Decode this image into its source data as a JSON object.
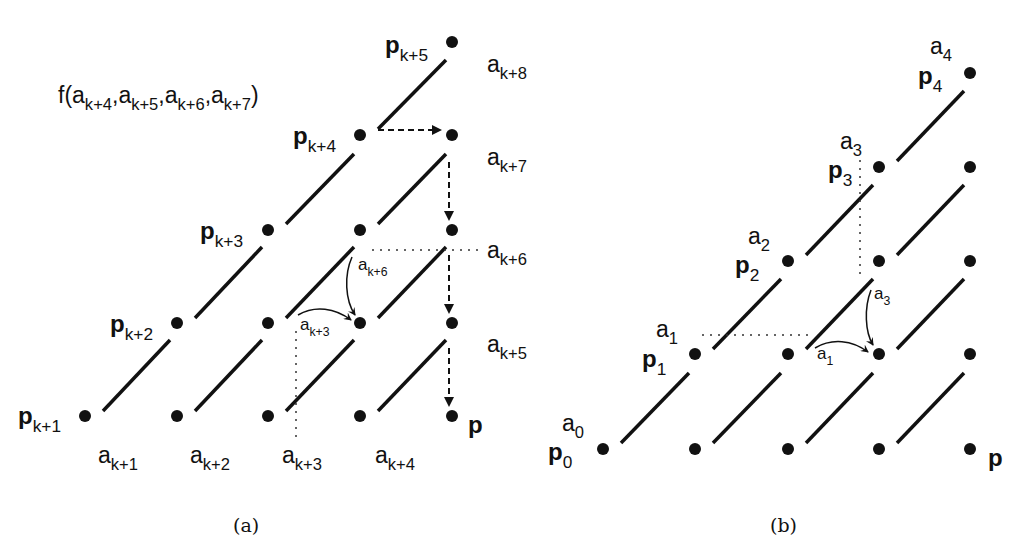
{
  "panel_a": {
    "caption": "(a)",
    "function_label": {
      "prefix": "f(",
      "args": [
        {
          "base": "a",
          "sub": "k+4"
        },
        {
          "base": "a",
          "sub": "k+5"
        },
        {
          "base": "a",
          "sub": "k+6"
        },
        {
          "base": "a",
          "sub": "k+7"
        }
      ],
      "suffix": ")"
    },
    "point_labels": [
      {
        "base": "p",
        "sub": "k+1"
      },
      {
        "base": "p",
        "sub": "k+2"
      },
      {
        "base": "p",
        "sub": "k+3"
      },
      {
        "base": "p",
        "sub": "k+4"
      },
      {
        "base": "p",
        "sub": "k+5"
      },
      {
        "base": "p",
        "sub": ""
      }
    ],
    "bottom_labels": [
      {
        "base": "a",
        "sub": "k+1"
      },
      {
        "base": "a",
        "sub": "k+2"
      },
      {
        "base": "a",
        "sub": "k+3"
      },
      {
        "base": "a",
        "sub": "k+4"
      }
    ],
    "right_labels": [
      {
        "base": "a",
        "sub": "k+8"
      },
      {
        "base": "a",
        "sub": "k+7"
      },
      {
        "base": "a",
        "sub": "k+6"
      },
      {
        "base": "a",
        "sub": "k+5"
      }
    ],
    "arrow_labels": [
      {
        "base": "a",
        "sub": "k+6"
      },
      {
        "base": "a",
        "sub": "k+3"
      }
    ]
  },
  "panel_b": {
    "caption": "(b)",
    "point_labels": [
      {
        "base": "p",
        "sub": "0",
        "a": "a",
        "a_sub": "0"
      },
      {
        "base": "p",
        "sub": "1",
        "a": "a",
        "a_sub": "1"
      },
      {
        "base": "p",
        "sub": "2",
        "a": "a",
        "a_sub": "2"
      },
      {
        "base": "p",
        "sub": "3",
        "a": "a",
        "a_sub": "3"
      },
      {
        "base": "p",
        "sub": "4",
        "a": "a",
        "a_sub": "4"
      },
      {
        "base": "p",
        "sub": ""
      }
    ],
    "arrow_labels": [
      {
        "base": "a",
        "sub": "3"
      },
      {
        "base": "a",
        "sub": "1"
      }
    ]
  }
}
